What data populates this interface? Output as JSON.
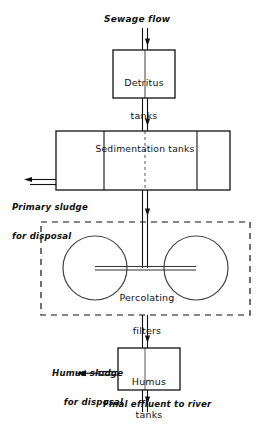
{
  "diagram": {
    "background_color": "#ffffff",
    "line_color": "#111111",
    "labels": {
      "sewage_flow": "Sewage flow",
      "detritus_tanks_line1": "Detritus",
      "detritus_tanks_line2": "tanks",
      "sedimentation_tanks": "Sedimentation tanks",
      "primary_sludge_line1": "Primary sludge",
      "primary_sludge_line2": "for disposal",
      "percolating_filters_line1": "Percolating",
      "percolating_filters_line2": "filters",
      "humus_sludge_line1": "Humus sludge",
      "humus_sludge_line2": "for disposal",
      "humus_tanks_line1": "Humus",
      "humus_tanks_line2": "tanks",
      "final_effluent": "Final effluent to river"
    },
    "nodes": [
      {
        "id": "detritus-tanks",
        "label": "Detritus tanks",
        "shape": "rectangle"
      },
      {
        "id": "sedimentation-tanks",
        "label": "Sedimentation tanks",
        "shape": "rectangle-3-compartments"
      },
      {
        "id": "percolating-filters",
        "label": "Percolating filters",
        "shape": "dashed-enclosure-two-circles"
      },
      {
        "id": "humus-tanks",
        "label": "Humus tanks",
        "shape": "rectangle"
      }
    ],
    "flows": [
      {
        "id": "inflow",
        "label": "Sewage flow",
        "direction": "down"
      },
      {
        "id": "detritus-to-sedimentation",
        "label": "",
        "direction": "down"
      },
      {
        "id": "primary-sludge-outflow",
        "label": "Primary sludge for disposal",
        "direction": "left"
      },
      {
        "id": "sedimentation-to-filters",
        "label": "",
        "direction": "down"
      },
      {
        "id": "filters-to-humus",
        "label": "",
        "direction": "down"
      },
      {
        "id": "humus-sludge-outflow",
        "label": "Humus sludge for disposal",
        "direction": "left"
      },
      {
        "id": "final-effluent-outflow",
        "label": "Final effluent to river",
        "direction": "down"
      }
    ]
  }
}
